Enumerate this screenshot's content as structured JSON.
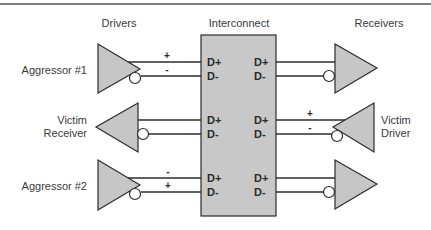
{
  "headers": {
    "drivers": "Drivers",
    "interconnect": "Interconnect",
    "receivers": "Receivers"
  },
  "rows": [
    {
      "name": "aggressor-1",
      "left_label": "Aggressor #1",
      "left_type": "driver",
      "right_type": "receiver",
      "signs": [
        "+",
        "-"
      ],
      "sign_side": "left",
      "pins_left": [
        "D+",
        "D-"
      ],
      "pins_right": [
        "D+",
        "D-"
      ]
    },
    {
      "name": "victim",
      "left_label_line1": "Victim",
      "left_label_line2": "Receiver",
      "right_label_line1": "Victim",
      "right_label_line2": "Driver",
      "left_type": "receiver",
      "right_type": "driver",
      "signs": [
        "+",
        "-"
      ],
      "sign_side": "right",
      "pins_left": [
        "D+",
        "D-"
      ],
      "pins_right": [
        "D+",
        "D-"
      ]
    },
    {
      "name": "aggressor-2",
      "left_label": "Aggressor #2",
      "left_type": "driver",
      "right_type": "receiver",
      "signs": [
        "-",
        "+"
      ],
      "sign_side": "left",
      "pins_left": [
        "D+",
        "D-"
      ],
      "pins_right": [
        "D+",
        "D-"
      ]
    }
  ],
  "colors": {
    "interconnect_fill": "#c8c8c8",
    "buffer_fill": "#c6c6c6",
    "line": "#2b2b2b",
    "text": "#3a3a3a",
    "background": "#ffffff"
  }
}
